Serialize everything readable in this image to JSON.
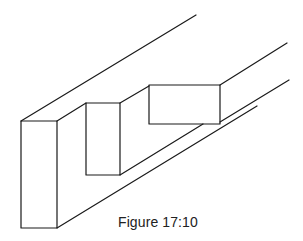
{
  "figure": {
    "caption": "Figure 17:10",
    "stroke_color": "#1a1a1a",
    "background_color": "#ffffff"
  }
}
